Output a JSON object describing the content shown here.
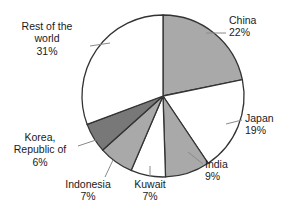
{
  "chart_data": {
    "type": "pie",
    "title": "",
    "subtitle": "",
    "xlabel": "",
    "ylabel": "",
    "legend_position": "none",
    "grid": false,
    "units": "percent",
    "start_angle_deg": 0,
    "direction": "clockwise",
    "categories": [
      "China",
      "Japan",
      "India",
      "Kuwait",
      "Indonesia",
      "Korea, Republic of",
      "Rest of the world"
    ],
    "values": [
      22,
      19,
      9,
      7,
      7,
      6,
      31
    ],
    "value_labels": [
      "22%",
      "19%",
      "9%",
      "7%",
      "7%",
      "6%",
      "31%"
    ],
    "slice_colors": [
      "#a9a9a9",
      "#ffffff",
      "#a9a9a9",
      "#ffffff",
      "#a9a9a9",
      "#787878",
      "#ffffff"
    ],
    "outline_color": "#333333",
    "slices": [
      {
        "label": "China",
        "value": 22,
        "value_label": "22%",
        "color": "#a9a9a9"
      },
      {
        "label": "Japan",
        "value": 19,
        "value_label": "19%",
        "color": "#ffffff"
      },
      {
        "label": "India",
        "value": 9,
        "value_label": "9%",
        "color": "#a9a9a9"
      },
      {
        "label": "Kuwait",
        "value": 7,
        "value_label": "7%",
        "color": "#ffffff"
      },
      {
        "label": "Indonesia",
        "value": 7,
        "value_label": "7%",
        "color": "#a9a9a9"
      },
      {
        "label": "Korea, Republic of",
        "value": 6,
        "value_label": "6%",
        "color": "#787878"
      },
      {
        "label": "Rest of the world",
        "value": 31,
        "value_label": "31%",
        "color": "#ffffff"
      }
    ]
  },
  "labels": {
    "china": {
      "line1": "China",
      "line2": "22%"
    },
    "japan": {
      "line1": "Japan",
      "line2": "19%"
    },
    "india": {
      "line1": "India",
      "line2": "9%"
    },
    "kuwait": {
      "line1": "Kuwait",
      "line2": "7%"
    },
    "indonesia": {
      "line1": "Indonesia",
      "line2": "7%"
    },
    "korea": {
      "line1": "Korea,",
      "line2": "Republic of",
      "line3": "6%"
    },
    "restworld": {
      "line1": "Rest of the",
      "line2": "world",
      "line3": "31%"
    }
  }
}
